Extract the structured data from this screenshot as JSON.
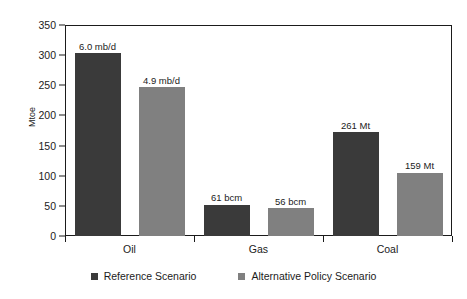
{
  "chart_data": {
    "type": "bar",
    "title": "",
    "xlabel": "",
    "ylabel": "Mtoe",
    "ylim": [
      0,
      350
    ],
    "yticks": [
      350,
      300,
      250,
      200,
      150,
      100,
      50,
      0
    ],
    "grid": false,
    "legend_position": "bottom",
    "categories": [
      "Oil",
      "Gas",
      "Coal"
    ],
    "series": [
      {
        "name": "Reference Scenario",
        "color": "#3a3a3a",
        "values": [
          303,
          52,
          172
        ],
        "point_labels": [
          "6.0 mb/d",
          "61 bcm",
          "261 Mt"
        ]
      },
      {
        "name": "Alternative Policy Scenario",
        "color": "#808080",
        "values": [
          247,
          46,
          105
        ],
        "point_labels": [
          "4.9 mb/d",
          "56 bcm",
          "159 Mt"
        ]
      }
    ]
  },
  "axis": {
    "y_label": "Mtoe",
    "y_tick_labels": [
      "350",
      "300",
      "250",
      "200",
      "150",
      "100",
      "50",
      "0"
    ],
    "x_tick_labels": [
      "Oil",
      "Gas",
      "Coal"
    ]
  },
  "legend": {
    "items": [
      {
        "label": "Reference Scenario",
        "color": "#3a3a3a"
      },
      {
        "label": "Alternative Policy Scenario",
        "color": "#808080"
      }
    ]
  },
  "colors": {
    "reference": "#3a3a3a",
    "alternative": "#808080",
    "axis": "#1b1b1b",
    "background": "#ffffff"
  }
}
